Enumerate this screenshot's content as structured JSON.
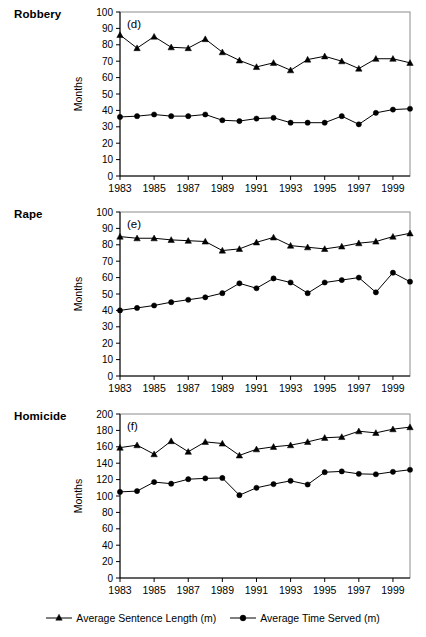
{
  "figure": {
    "width": 426,
    "height": 637,
    "background": "#ffffff",
    "line_color": "#000000",
    "frame_color": "#8c8c8c"
  },
  "legend": {
    "position": "bottom-center",
    "entries": [
      {
        "label": "Average Sentence Length (m)",
        "marker": "triangle-marker"
      },
      {
        "label": "Average Time Served (m)",
        "marker": "circle-marker"
      }
    ]
  },
  "chart_data": [
    {
      "type": "line",
      "title": "Robbery",
      "panel_letter": "(d)",
      "xlabel": "",
      "ylabel": "Months",
      "grid": false,
      "legend_position": "bottom-center",
      "x": [
        1983,
        1984,
        1985,
        1986,
        1987,
        1988,
        1989,
        1990,
        1991,
        1992,
        1993,
        1994,
        1995,
        1996,
        1997,
        1998,
        1999,
        2000
      ],
      "xlim": [
        1983,
        2000
      ],
      "xticks": [
        1983,
        1985,
        1987,
        1989,
        1991,
        1993,
        1995,
        1997,
        1999
      ],
      "xtick_labels": [
        "1983",
        "1985",
        "1987",
        "1989",
        "1991",
        "1993",
        "1995",
        "1997",
        "1999"
      ],
      "ylim": [
        0,
        100
      ],
      "yticks": [
        0,
        10,
        20,
        30,
        40,
        50,
        60,
        70,
        80,
        90,
        100
      ],
      "ytick_labels": [
        "0",
        "10",
        "20",
        "30",
        "40",
        "50",
        "60",
        "70",
        "80",
        "90",
        "100"
      ],
      "series": [
        {
          "name": "Average Sentence Length (m)",
          "marker": "triangle",
          "values": [
            86,
            78,
            85,
            78.5,
            78,
            83.5,
            75.5,
            70.5,
            66.5,
            69,
            64.5,
            71,
            73,
            70,
            65.5,
            71.5,
            71.5,
            69
          ]
        },
        {
          "name": "Average Time Served (m)",
          "marker": "circle",
          "values": [
            36,
            36.5,
            37.5,
            36.5,
            36.5,
            37.5,
            34,
            33.5,
            35,
            35.5,
            32.5,
            32.5,
            32.5,
            36.5,
            31.5,
            38.5,
            40.5,
            41
          ]
        }
      ]
    },
    {
      "type": "line",
      "title": "Rape",
      "panel_letter": "(e)",
      "xlabel": "",
      "ylabel": "Months",
      "grid": false,
      "legend_position": "bottom-center",
      "x": [
        1983,
        1984,
        1985,
        1986,
        1987,
        1988,
        1989,
        1990,
        1991,
        1992,
        1993,
        1994,
        1995,
        1996,
        1997,
        1998,
        1999,
        2000
      ],
      "xlim": [
        1983,
        2000
      ],
      "xticks": [
        1983,
        1985,
        1987,
        1989,
        1991,
        1993,
        1995,
        1997,
        1999
      ],
      "xtick_labels": [
        "1983",
        "1985",
        "1987",
        "1989",
        "1991",
        "1993",
        "1995",
        "1997",
        "1999"
      ],
      "ylim": [
        0,
        100
      ],
      "yticks": [
        0,
        10,
        20,
        30,
        40,
        50,
        60,
        70,
        80,
        90,
        100
      ],
      "ytick_labels": [
        "0",
        "10",
        "20",
        "30",
        "40",
        "50",
        "60",
        "70",
        "80",
        "90",
        "100"
      ],
      "series": [
        {
          "name": "Average Sentence Length (m)",
          "marker": "triangle",
          "values": [
            85,
            84,
            84,
            83,
            82.5,
            82,
            76.5,
            77.5,
            81.5,
            84.5,
            79.5,
            78.5,
            77.5,
            79,
            81,
            82,
            85,
            87
          ]
        },
        {
          "name": "Average Time Served (m)",
          "marker": "circle",
          "values": [
            40,
            41.5,
            43,
            45,
            46.5,
            48,
            50.5,
            56.5,
            53.5,
            59.5,
            57,
            50.5,
            57,
            58.5,
            60,
            51,
            63,
            57.5
          ]
        }
      ]
    },
    {
      "type": "line",
      "title": "Homicide",
      "panel_letter": "(f)",
      "xlabel": "",
      "ylabel": "Months",
      "grid": false,
      "legend_position": "bottom-center",
      "x": [
        1983,
        1984,
        1985,
        1986,
        1987,
        1988,
        1989,
        1990,
        1991,
        1992,
        1993,
        1994,
        1995,
        1996,
        1997,
        1998,
        1999,
        2000
      ],
      "xlim": [
        1983,
        2000
      ],
      "xticks": [
        1983,
        1985,
        1987,
        1989,
        1991,
        1993,
        1995,
        1997,
        1999
      ],
      "xtick_labels": [
        "1983",
        "1985",
        "1987",
        "1989",
        "1991",
        "1993",
        "1995",
        "1997",
        "1999"
      ],
      "ylim": [
        0,
        200
      ],
      "yticks": [
        0,
        20,
        40,
        60,
        80,
        100,
        120,
        140,
        160,
        180,
        200
      ],
      "ytick_labels": [
        "0",
        "20",
        "40",
        "60",
        "80",
        "100",
        "120",
        "140",
        "160",
        "180",
        "200"
      ],
      "series": [
        {
          "name": "Average Sentence Length (m)",
          "marker": "triangle",
          "values": [
            159,
            162,
            151,
            167,
            154,
            166,
            164,
            149.5,
            157,
            160,
            162,
            166,
            171,
            172,
            179,
            177,
            181.5,
            184
          ]
        },
        {
          "name": "Average Time Served (m)",
          "marker": "circle",
          "values": [
            105,
            106,
            117,
            115,
            120.5,
            121.5,
            122,
            101,
            110,
            114.5,
            118.5,
            114,
            129,
            130,
            127,
            126.5,
            129.5,
            132
          ]
        }
      ]
    }
  ]
}
